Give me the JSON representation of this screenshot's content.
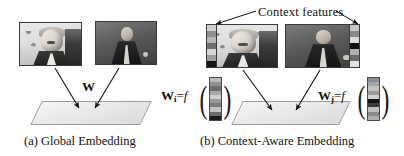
{
  "figure": {
    "panels": [
      {
        "id": "a",
        "caption": "(a) Global Embedding",
        "mapping_label": "W",
        "photos": [
          {
            "name": "photo-man-a",
            "subject": "man-speaking-at-podium-light-backdrop"
          },
          {
            "name": "photo-woman-a",
            "subject": "woman-speaking-dark-backdrop"
          }
        ]
      },
      {
        "id": "b",
        "caption": "(b) Context-Aware Embedding",
        "context_title": "Context  features",
        "photos": [
          {
            "name": "photo-man-b",
            "subject": "man-speaking-at-podium-light-backdrop"
          },
          {
            "name": "photo-woman-b",
            "subject": "woman-speaking-dark-backdrop"
          }
        ],
        "formulas": [
          {
            "name": "formula-wi",
            "weight": "W",
            "subscript": "i",
            "equals": "=",
            "function": "f"
          },
          {
            "name": "formula-wj",
            "weight": "W",
            "subscript": "j",
            "equals": "=",
            "function": "f"
          }
        ]
      }
    ],
    "colors": {
      "plane_fill": "#eeeeee",
      "plane_edge": "#9c9c9c",
      "arrow": "#111111",
      "text": "#111111"
    },
    "feature_vectors": {
      "wi_vector": [
        "#b9b9b9",
        "#8f8f8f",
        "#6e6e6e",
        "#a8a8a8",
        "#cfcfcf",
        "#9a9a9a",
        "#7c7c7c",
        "#c4c4c4",
        "#6a6a6a",
        "#1c1c1c"
      ],
      "wj_vector": [
        "#8c8c8c",
        "#a6a6a6",
        "#c2c2c2",
        "#9b9b9b",
        "#d2d2d2",
        "#141414",
        "#3a3a3a",
        "#bdbdbd",
        "#8a8a8a",
        "#adadad"
      ],
      "ctx_strip_man": [
        "#cfcfcf",
        "#8e8e8e",
        "#b6b6b6",
        "#707070",
        "#d5d5d5",
        "#9d9d9d",
        "#151515"
      ],
      "ctx_strip_woman": [
        "#c8c8c8",
        "#8a8a8a",
        "#dcdcdc",
        "#101010",
        "#b0b0b0",
        "#6b6b6b",
        "#e0e0e0"
      ]
    }
  }
}
